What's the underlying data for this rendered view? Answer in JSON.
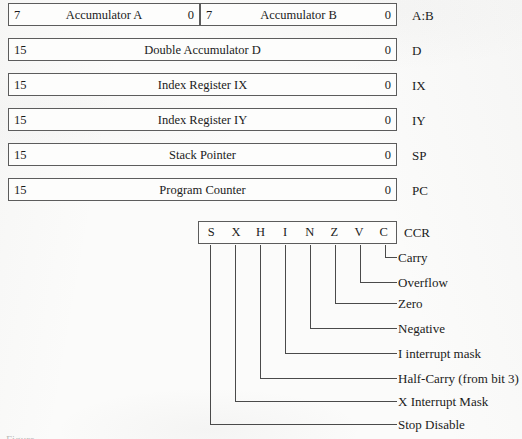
{
  "registers": [
    {
      "name": "A:B",
      "cells": [
        {
          "msb": "7",
          "title": "Accumulator A",
          "lsb": "0"
        },
        {
          "msb": "7",
          "title": "Accumulator B",
          "lsb": "0"
        }
      ]
    },
    {
      "name": "D",
      "cells": [
        {
          "msb": "15",
          "title": "Double Accumulator D",
          "lsb": "0"
        }
      ]
    },
    {
      "name": "IX",
      "cells": [
        {
          "msb": "15",
          "title": "Index Register IX",
          "lsb": "0"
        }
      ]
    },
    {
      "name": "IY",
      "cells": [
        {
          "msb": "15",
          "title": "Index Register IY",
          "lsb": "0"
        }
      ]
    },
    {
      "name": "SP",
      "cells": [
        {
          "msb": "15",
          "title": "Stack Pointer",
          "lsb": "0"
        }
      ]
    },
    {
      "name": "PC",
      "cells": [
        {
          "msb": "15",
          "title": "Program Counter",
          "lsb": "0"
        }
      ]
    }
  ],
  "ccr": {
    "name": "CCR",
    "bits": [
      "S",
      "X",
      "H",
      "I",
      "N",
      "Z",
      "V",
      "C"
    ],
    "flag_labels": [
      "Carry",
      "Overflow",
      "Zero",
      "Negative",
      "I interrupt mask",
      "Half-Carry (from bit 3)",
      "X Interrupt Mask",
      "Stop Disable"
    ]
  },
  "caption": "Figure",
  "colors": {
    "line": "#4a4a4a",
    "box_border": "#5c5c5c",
    "text": "#1b1b1b",
    "paper": "#fbfbfa"
  }
}
